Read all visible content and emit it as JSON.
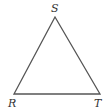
{
  "diagram": {
    "type": "triangle",
    "vertices": [
      {
        "label": "S",
        "x": 55,
        "y": 17
      },
      {
        "label": "R",
        "x": 14,
        "y": 94
      },
      {
        "label": "T",
        "x": 100,
        "y": 94
      }
    ],
    "stroke_color": "#555555",
    "label_color": "#333333"
  }
}
